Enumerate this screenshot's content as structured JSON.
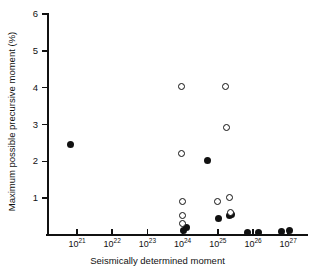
{
  "chart_data": {
    "type": "scatter",
    "title": "",
    "xlabel": "Seismically determined moment",
    "ylabel": "Maximum possible precursive moment (%)",
    "xscale": "log",
    "yscale": "linear",
    "xlim": [
      1e+20,
      2.5e+27
    ],
    "ylim": [
      0,
      6
    ],
    "yticks": [
      0,
      1,
      2,
      3,
      4,
      5,
      6
    ],
    "ytick_labels": [
      "",
      "1",
      "2",
      "3",
      "4",
      "5",
      "6"
    ],
    "xticks": [
      1e+21,
      1e+22,
      1e+23,
      1e+24,
      1e+25,
      1e+26,
      1e+27
    ],
    "xtick_labels": [
      "10^21",
      "10^22",
      "10^23",
      "10^24",
      "10^25",
      "10^26",
      "10^27"
    ],
    "xtick_mantissa": "10",
    "xtick_exponents": [
      "21",
      "22",
      "23",
      "24",
      "25",
      "26",
      "27"
    ],
    "grid": false,
    "legend": false,
    "series": [
      {
        "name": "filled",
        "marker": "filled-circle",
        "color": "#111111",
        "points": [
          {
            "x_exp": 20.82,
            "y": 2.47
          },
          {
            "x_exp": 24.02,
            "y": 0.13
          },
          {
            "x_exp": 24.1,
            "y": 0.2
          },
          {
            "x_exp": 24.7,
            "y": 2.02
          },
          {
            "x_exp": 25.03,
            "y": 0.46
          },
          {
            "x_exp": 25.32,
            "y": 0.53
          },
          {
            "x_exp": 25.4,
            "y": 0.56
          },
          {
            "x_exp": 25.84,
            "y": 0.07
          },
          {
            "x_exp": 26.16,
            "y": 0.06
          },
          {
            "x_exp": 26.8,
            "y": 0.1
          },
          {
            "x_exp": 27.05,
            "y": 0.13
          }
        ]
      },
      {
        "name": "open",
        "marker": "open-circle",
        "color": "#111111",
        "points": [
          {
            "x_exp": 23.98,
            "y": 4.02
          },
          {
            "x_exp": 23.98,
            "y": 2.22
          },
          {
            "x_exp": 23.99,
            "y": 0.91
          },
          {
            "x_exp": 23.99,
            "y": 0.53
          },
          {
            "x_exp": 23.99,
            "y": 0.3
          },
          {
            "x_exp": 25.0,
            "y": 0.91
          },
          {
            "x_exp": 25.22,
            "y": 4.03
          },
          {
            "x_exp": 25.26,
            "y": 2.93
          },
          {
            "x_exp": 25.34,
            "y": 1.02
          },
          {
            "x_exp": 25.36,
            "y": 0.62
          }
        ]
      }
    ]
  }
}
